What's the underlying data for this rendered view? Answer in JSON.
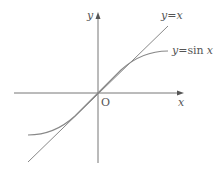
{
  "diagram": {
    "type": "function-graph",
    "axes": {
      "x_label": "x",
      "y_label": "y",
      "origin_label": "O"
    },
    "curves": [
      {
        "name": "line",
        "label": "y=x",
        "label_y": "y",
        "label_eq": "=",
        "label_rhs": "x"
      },
      {
        "name": "sine",
        "label": "y=sin x",
        "label_y": "y",
        "label_eq": "=",
        "label_fn": "sin",
        "label_arg": "x"
      }
    ],
    "colors": {
      "axes": "#777777",
      "curves": "#888888",
      "text": "#555555"
    }
  }
}
